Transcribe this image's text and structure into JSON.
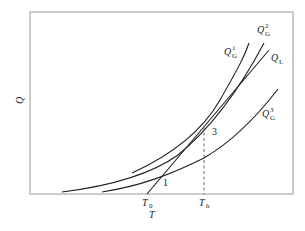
{
  "diagram": {
    "type": "heat-balance curves (Semenov diagram)",
    "axes": {
      "x_label": "T",
      "y_label": "Q"
    },
    "x_ticks": [
      {
        "main": "T",
        "sub": "0"
      },
      {
        "main": "T",
        "sub": "h"
      }
    ],
    "curves": [
      {
        "id": "QG1",
        "main": "Q",
        "sub": "G",
        "sup": "1"
      },
      {
        "id": "QG2",
        "main": "Q",
        "sub": "G",
        "sup": "2"
      },
      {
        "id": "QL",
        "main": "Q",
        "sub": "L",
        "sup": ""
      },
      {
        "id": "QG3",
        "main": "Q",
        "sub": "G",
        "sup": "3"
      }
    ],
    "points": [
      {
        "label": "1"
      },
      {
        "label": "3"
      }
    ]
  }
}
